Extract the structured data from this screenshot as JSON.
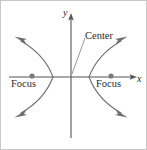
{
  "figure": {
    "type": "conic-section-diagram",
    "width": 147,
    "height": 150,
    "background_color": "#ffffff",
    "border_color": "#c8c8c8",
    "stroke_color": "#6e6e6e",
    "axis_color": "#555555",
    "text_color": "#2b2b2b",
    "point_color": "#7a7a7a"
  },
  "axes": {
    "x_label": "x",
    "y_label": "y",
    "origin": {
      "x": 70,
      "y": 76
    },
    "x_start": {
      "x": 8,
      "y": 76
    },
    "x_end": {
      "x": 135,
      "y": 76
    },
    "y_start": {
      "x": 70,
      "y": 137
    },
    "y_end": {
      "x": 70,
      "y": 13
    }
  },
  "labels": {
    "focus_left": "Focus",
    "focus_right": "Focus",
    "center": "Center"
  },
  "points": [
    {
      "name": "focus-left",
      "label": "Focus",
      "x": 31,
      "y": 75
    },
    {
      "name": "focus-right",
      "label": "Focus",
      "x": 110,
      "y": 75
    },
    {
      "name": "center",
      "label": "Center",
      "x": 70,
      "y": 76
    }
  ],
  "leader_line": {
    "from": {
      "x": 84,
      "y": 37
    },
    "to": {
      "x": 71,
      "y": 73
    }
  },
  "curves": [
    {
      "name": "left-branch",
      "opens": "left",
      "vertex": {
        "x": 52,
        "y": 76
      },
      "path": "M 20 40 C 34 48 46 60 52 76 C 46 92 34 104 20 112",
      "arrow_ends": [
        "upper-left",
        "lower-left"
      ]
    },
    {
      "name": "right-branch",
      "opens": "right",
      "vertex": {
        "x": 88,
        "y": 76
      },
      "path": "M 120 40 C 106 48 94 60 88 76 C 94 92 106 104 120 112",
      "arrow_ends": [
        "upper-right",
        "lower-right"
      ]
    }
  ],
  "arrowheads": [
    {
      "name": "curve-arrow-upper-left",
      "x": 20,
      "y": 40,
      "angle": -150
    },
    {
      "name": "curve-arrow-lower-left",
      "x": 20,
      "y": 112,
      "angle": 150
    },
    {
      "name": "curve-arrow-upper-right",
      "x": 120,
      "y": 40,
      "angle": -30
    },
    {
      "name": "curve-arrow-lower-right",
      "x": 120,
      "y": 112,
      "angle": 30
    },
    {
      "name": "axis-arrow-x",
      "x": 135,
      "y": 76,
      "angle": 0
    },
    {
      "name": "axis-arrow-y",
      "x": 70,
      "y": 13,
      "angle": -90
    }
  ]
}
